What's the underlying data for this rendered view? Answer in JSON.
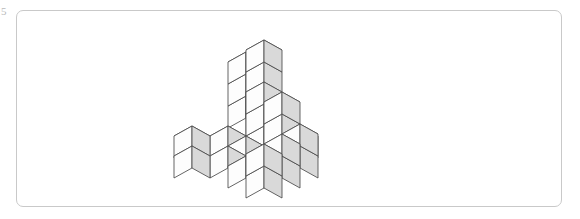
{
  "figure": {
    "label": "5",
    "panel": {
      "border_color": "#c9c9c9",
      "background_color": "#ffffff",
      "corner_radius": 7,
      "x": 16,
      "y": 10,
      "width": 546,
      "height": 197
    },
    "colors": {
      "top_face": "#ffffff",
      "left_face": "#fdfdfd",
      "right_face": "#d9d9d9",
      "edge": "#4a4a4a",
      "page_background": "#ffffff"
    },
    "projection": {
      "type": "isometric",
      "cube_half_width": 18,
      "cube_half_depth": 10,
      "cube_height": 22,
      "origin_x": 246,
      "origin_y": 118
    },
    "cube_count": 28,
    "cubes": [
      {
        "x": 0,
        "y": 0,
        "z": 0
      },
      {
        "x": 0,
        "y": 0,
        "z": 1
      },
      {
        "x": 0,
        "y": 0,
        "z": 2
      },
      {
        "x": 1,
        "y": 0,
        "z": 0
      },
      {
        "x": 1,
        "y": 0,
        "z": 1
      },
      {
        "x": 1,
        "y": 0,
        "z": 2
      },
      {
        "x": 1,
        "y": 0,
        "z": 3
      },
      {
        "x": 2,
        "y": 0,
        "z": 0
      },
      {
        "x": 2,
        "y": 1,
        "z": 0
      },
      {
        "x": 3,
        "y": 0,
        "z": 0
      },
      {
        "x": 3,
        "y": 1,
        "z": 0
      },
      {
        "x": 1,
        "y": 2,
        "z": 0
      },
      {
        "x": 2,
        "y": 2,
        "z": 0
      },
      {
        "x": 3,
        "y": 2,
        "z": 0
      },
      {
        "x": 2,
        "y": 3,
        "z": 0
      },
      {
        "x": 3,
        "y": 3,
        "z": 0
      },
      {
        "x": 2,
        "y": 1,
        "z": 1
      },
      {
        "x": 2,
        "y": 1,
        "z": 2
      },
      {
        "x": 3,
        "y": 1,
        "z": 1
      },
      {
        "x": 3,
        "y": 1,
        "z": 2
      },
      {
        "x": 4,
        "y": 1,
        "z": 0
      },
      {
        "x": 4,
        "y": 1,
        "z": 1
      },
      {
        "x": 4,
        "y": 2,
        "z": 0
      },
      {
        "x": 4,
        "y": 2,
        "z": 1
      },
      {
        "x": 4,
        "y": 3,
        "z": 0
      },
      {
        "x": 4,
        "y": 3,
        "z": 1
      },
      {
        "x": 0,
        "y": 3,
        "z": 0
      },
      {
        "x": 1,
        "y": 4,
        "z": 0
      }
    ]
  }
}
